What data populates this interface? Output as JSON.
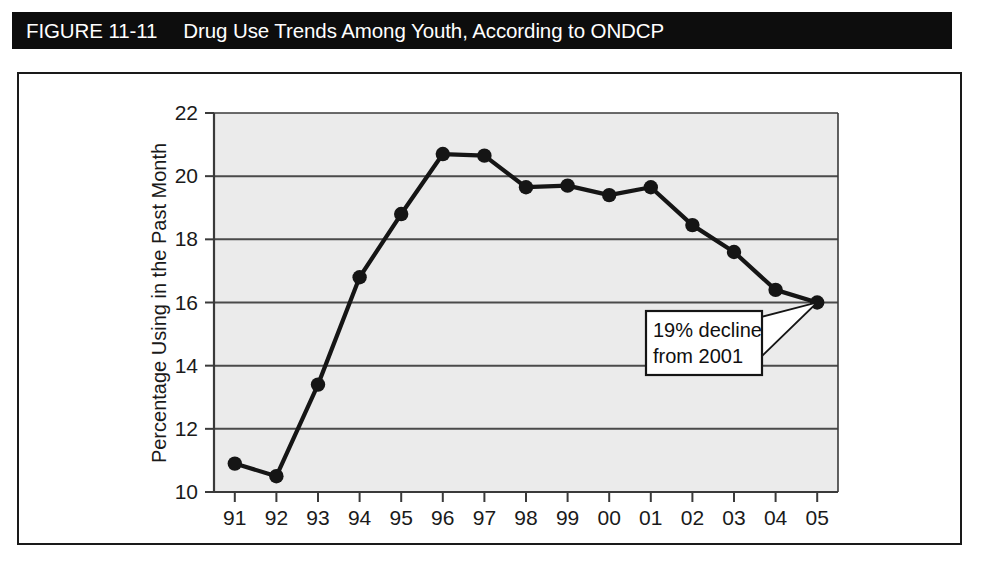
{
  "figure": {
    "label": "FIGURE 11-11",
    "title": "Drug Use Trends Among Youth, According to ONDCP",
    "banner_color": "#0d0d0d",
    "banner_text_color": "#ffffff",
    "frame_color": "#1a1a1a"
  },
  "chart_data": {
    "type": "line",
    "title": "Drug Use Trends Among Youth, According to ONDCP",
    "xlabel": "",
    "ylabel": "Percentage Using in the Past Month",
    "categories": [
      "91",
      "92",
      "93",
      "94",
      "95",
      "96",
      "97",
      "98",
      "99",
      "00",
      "01",
      "02",
      "03",
      "04",
      "05"
    ],
    "values": [
      10.9,
      10.5,
      13.4,
      16.8,
      18.8,
      20.7,
      20.65,
      19.65,
      19.7,
      19.4,
      19.65,
      18.45,
      17.6,
      16.4,
      16.0
    ],
    "ylim": [
      10,
      22
    ],
    "yticks": [
      10,
      12,
      14,
      16,
      18,
      20,
      22
    ],
    "ytick_labels": [
      "10",
      "12",
      "14",
      "16",
      "18",
      "20",
      "22"
    ],
    "grid": "horizontal",
    "legend": "none",
    "marker": "filled-circle",
    "line_color": "#151515",
    "marker_color": "#151515",
    "plot_background": "#ebebeb",
    "gridline_color": "#4a4a4a",
    "annotations": [
      {
        "name": "decline-callout",
        "line1": "19% decline",
        "line2": "from 2001",
        "points_to_category": "05",
        "points_to_value": 16.0
      }
    ]
  }
}
